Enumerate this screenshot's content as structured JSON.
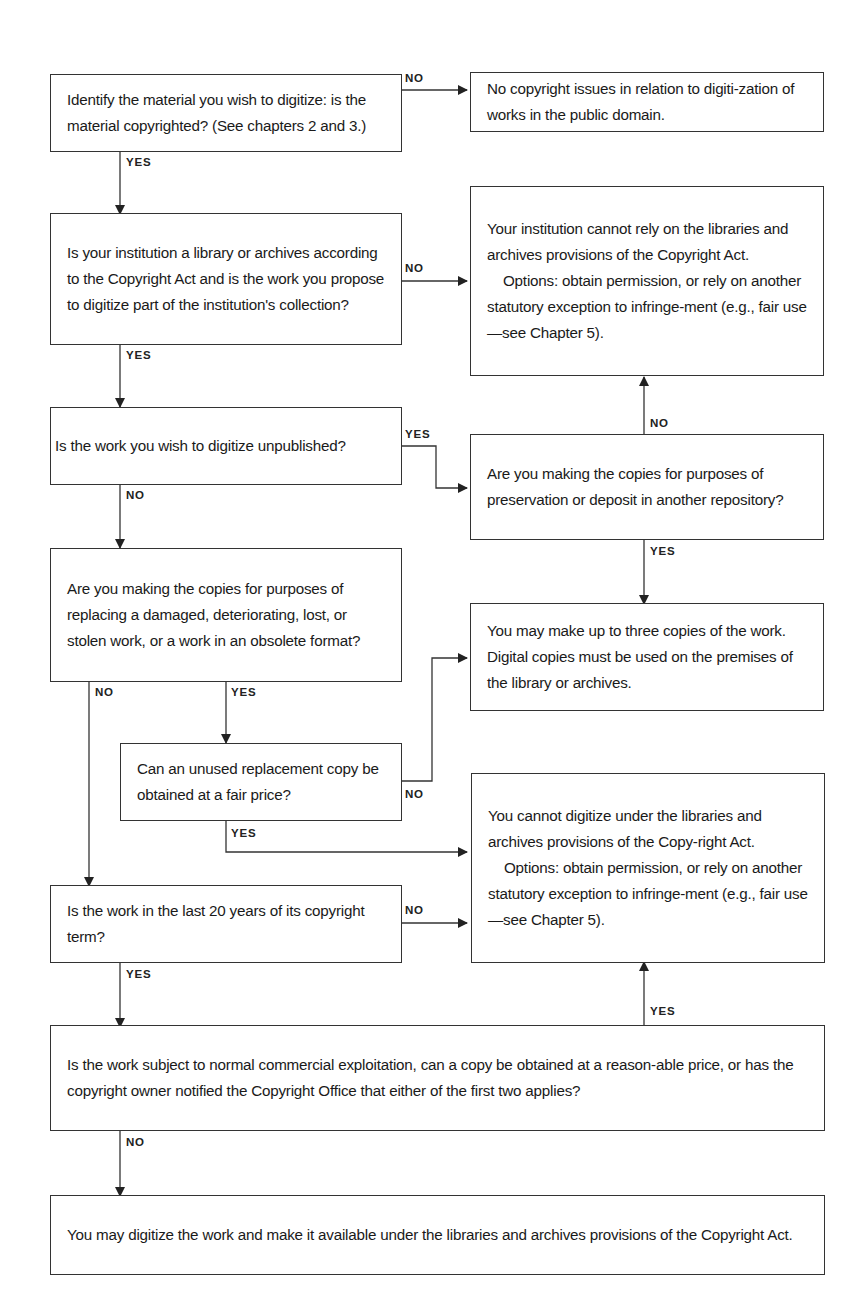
{
  "nodes": {
    "q_copyrighted": "Identify the material you wish to digitize: is the material copyrighted? (See chapters 2 and 3.)",
    "r_public_domain": "No copyright issues in relation to digiti-zation of works in the public domain.",
    "q_institution": "Is your institution a library or archives according to the Copyright Act and is the work you propose to digitize part of the institution's collection?",
    "r_cannot_rely": {
      "line1": "Your institution cannot rely on the libraries and archives provisions of the Copyright Act.",
      "line2": "Options: obtain permission, or rely on another statutory exception to infringe-ment (e.g., fair use—see Chapter 5)."
    },
    "q_unpublished": "Is the work you wish to digitize unpublished?",
    "q_preservation": "Are you making the copies for purposes of preservation or deposit in another repository?",
    "q_replacing": "Are you making the copies for purposes of replacing a damaged, deteriorating, lost, or stolen work, or a work in an obsolete format?",
    "r_three_copies": "You may make up to three copies of the work. Digital copies must be used on the premises of the library or archives.",
    "q_unused_replacement": "Can an unused replacement copy be obtained at a fair price?",
    "r_cannot_digitize": {
      "line1": "You cannot digitize under the libraries and archives provisions of the Copy-right Act.",
      "line2": "Options: obtain permission, or rely on another statutory exception to infringe-ment (e.g., fair use—see Chapter 5)."
    },
    "q_last_20_years": "Is the work in the last 20 years of its copyright term?",
    "q_commercial": "Is the work subject to normal commercial exploitation, can a copy be obtained at a reason-able price, or has the copyright owner notified the Copyright Office that either of the first two applies?",
    "r_may_digitize": "You may digitize the work and make it available under the libraries and archives provisions of the Copyright Act."
  },
  "edge_labels": {
    "copyrighted_no": "NO",
    "copyrighted_yes": "YES",
    "institution_no": "NO",
    "institution_yes": "YES",
    "unpublished_yes": "YES",
    "unpublished_no": "NO",
    "preservation_no": "NO",
    "preservation_yes": "YES",
    "replacing_no": "NO",
    "replacing_yes": "YES",
    "unused_no": "NO",
    "unused_yes": "YES",
    "last20_no": "NO",
    "last20_yes": "YES",
    "commercial_yes": "YES",
    "commercial_no": "NO"
  },
  "colors": {
    "line": "#333333",
    "text": "#1a1a1a",
    "background": "#ffffff"
  }
}
